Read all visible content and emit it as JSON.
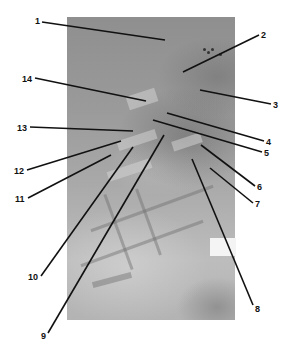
{
  "figure": {
    "type": "labeled specimen photograph",
    "photo_bounds": {
      "x": 67,
      "y": 17,
      "width": 168,
      "height": 303
    },
    "colors": {
      "leader": "#111111",
      "label": "#111111",
      "background": "#ffffff"
    },
    "callouts": [
      {
        "label": "1",
        "text_x": 35,
        "text_y": 17,
        "line": [
          42,
          22,
          165,
          40
        ]
      },
      {
        "label": "2",
        "text_x": 261,
        "text_y": 31,
        "line": [
          259,
          35,
          183,
          72
        ]
      },
      {
        "label": "3",
        "text_x": 273,
        "text_y": 101,
        "line": [
          271,
          104,
          200,
          90
        ]
      },
      {
        "label": "4",
        "text_x": 266,
        "text_y": 138,
        "line": [
          264,
          141,
          167,
          113
        ]
      },
      {
        "label": "5",
        "text_x": 264,
        "text_y": 149,
        "line": [
          262,
          152,
          153,
          120
        ]
      },
      {
        "label": "6",
        "text_x": 257,
        "text_y": 183,
        "line": [
          255,
          186,
          201,
          145
        ]
      },
      {
        "label": "7",
        "text_x": 255,
        "text_y": 200,
        "line": [
          253,
          203,
          210,
          168
        ]
      },
      {
        "label": "8",
        "text_x": 255,
        "text_y": 305,
        "line": [
          253,
          305,
          192,
          159
        ]
      },
      {
        "label": "9",
        "text_x": 41,
        "text_y": 332,
        "line": [
          48,
          333,
          164,
          135
        ]
      },
      {
        "label": "10",
        "text_x": 28,
        "text_y": 273,
        "line": [
          41,
          276,
          133,
          147
        ]
      },
      {
        "label": "11",
        "text_x": 15,
        "text_y": 195,
        "line": [
          28,
          198,
          111,
          155
        ]
      },
      {
        "label": "12",
        "text_x": 14,
        "text_y": 167,
        "line": [
          27,
          170,
          121,
          141
        ]
      },
      {
        "label": "13",
        "text_x": 17,
        "text_y": 124,
        "line": [
          30,
          127,
          133,
          131
        ]
      },
      {
        "label": "14",
        "text_x": 22,
        "text_y": 75,
        "line": [
          35,
          78,
          146,
          101
        ]
      }
    ]
  }
}
